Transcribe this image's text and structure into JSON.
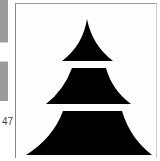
{
  "page_number": "47",
  "figure": {
    "fill_color": "#000000",
    "background_color": "#ffffff",
    "tiers": 3
  }
}
